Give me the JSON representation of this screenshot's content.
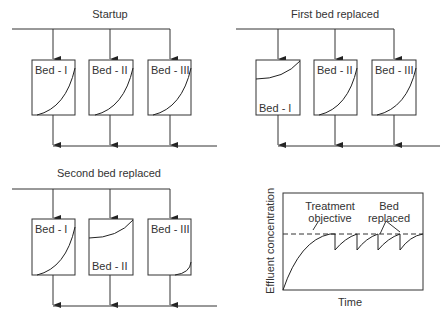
{
  "panels": [
    {
      "title": "Startup",
      "beds": [
        {
          "label": "Bed - I",
          "state": "exhausting"
        },
        {
          "label": "Bed - II",
          "state": "exhausting"
        },
        {
          "label": "Bed - III",
          "state": "exhausting"
        }
      ]
    },
    {
      "title": "First bed replaced",
      "beds": [
        {
          "label": "Bed - I",
          "state": "replaced"
        },
        {
          "label": "Bed - II",
          "state": "exhausting"
        },
        {
          "label": "Bed - III",
          "state": "exhausting"
        }
      ]
    },
    {
      "title": "Second bed replaced",
      "beds": [
        {
          "label": "Bed - I",
          "state": "exhausting"
        },
        {
          "label": "Bed - II",
          "state": "replaced"
        },
        {
          "label": "Bed - III",
          "state": "fresh"
        }
      ]
    }
  ],
  "chart": {
    "ylabel": "Effluent concentration",
    "xlabel": "Time",
    "annotation_objective_line1": "Treatment",
    "annotation_objective_line2": "objective",
    "annotation_replaced_line1": "Bed",
    "annotation_replaced_line2": "replaced"
  }
}
